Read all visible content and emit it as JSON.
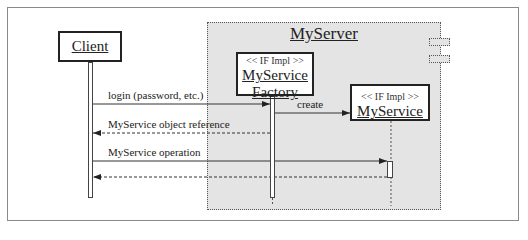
{
  "diagram": {
    "type": "UML sequence diagram",
    "container": {
      "name": "MyServer"
    },
    "participants": [
      {
        "id": "client",
        "name": "Client",
        "stereotype": ""
      },
      {
        "id": "factory",
        "name_line1": "MyService",
        "name_line2": "Factory",
        "stereotype": "<< IF Impl >>"
      },
      {
        "id": "service",
        "name": "MyService",
        "stereotype": "<< IF Impl >>"
      }
    ],
    "messages": [
      {
        "from": "client",
        "to": "factory",
        "label": "login (password, etc.)",
        "style": "solid"
      },
      {
        "from": "factory",
        "to": "service",
        "label": "create",
        "style": "solid"
      },
      {
        "from": "factory",
        "to": "client",
        "label": "MyService object reference",
        "style": "dashed"
      },
      {
        "from": "client",
        "to": "service",
        "label": "MyService operation",
        "style": "solid"
      },
      {
        "from": "service",
        "to": "client",
        "label": "",
        "style": "dashed"
      }
    ],
    "colors": {
      "container_fill": "#e4e4e4",
      "line": "#333333",
      "box_fill": "#ffffff"
    }
  }
}
